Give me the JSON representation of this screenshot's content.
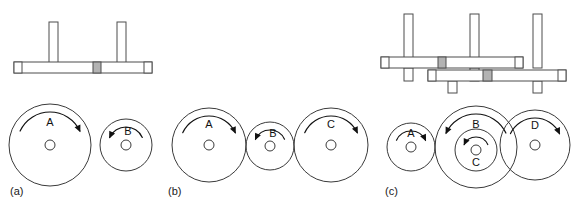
{
  "figure": {
    "background_color": "#ffffff",
    "outline_color": "#4d4d4d",
    "wheel_stroke_color": "#3a3a3a",
    "shaded_block_color": "#b3b3b3",
    "arrow_color": "#111111",
    "width": 578,
    "height": 207
  },
  "panels": [
    {
      "id": "a",
      "caption": "(a)",
      "caption_x": 10,
      "caption_y": 192,
      "description": "Two meshing wheels on a single shaft assembly",
      "side_view": {
        "shafts": [
          {
            "name": "main-shaft",
            "x": 14,
            "y": 62,
            "width": 138,
            "height": 11,
            "end_caps": [
              {
                "x": 14,
                "y": 62,
                "width": 8,
                "height": 11
              },
              {
                "x": 144,
                "y": 62,
                "width": 8,
                "height": 11
              }
            ],
            "shaded_blocks": [
              {
                "x": 93,
                "y": 62,
                "width": 8,
                "height": 11
              }
            ]
          }
        ],
        "posts": [
          {
            "name": "post-a",
            "x": 49,
            "y": 22,
            "width": 9,
            "height": 48
          },
          {
            "name": "post-b",
            "x": 117,
            "y": 22,
            "width": 9,
            "height": 48
          }
        ]
      },
      "wheels": [
        {
          "name": "wheel-a",
          "label": "A",
          "cx": 50,
          "cy": 145,
          "r": 41,
          "hub_r": 5,
          "direction": "clockwise",
          "label_dx": 0,
          "label_dy": -22
        },
        {
          "name": "wheel-b",
          "label": "B",
          "cx": 126,
          "cy": 145,
          "r": 26,
          "hub_r": 5,
          "direction": "counterclockwise",
          "label_dx": 2,
          "label_dy": -13
        }
      ]
    },
    {
      "id": "b",
      "caption": "(b)",
      "caption_x": 168,
      "caption_y": 192,
      "description": "Three wheels in series: large, small idler, large",
      "side_view": {
        "shafts": [],
        "posts": []
      },
      "wheels": [
        {
          "name": "wheel-a",
          "label": "A",
          "cx": 209,
          "cy": 145,
          "r": 37,
          "hub_r": 5,
          "direction": "clockwise",
          "label_dx": 0,
          "label_dy": -20
        },
        {
          "name": "wheel-b",
          "label": "B",
          "cx": 270,
          "cy": 146,
          "r": 24,
          "hub_r": 5,
          "direction": "counterclockwise",
          "label_dx": 3,
          "label_dy": -12
        },
        {
          "name": "wheel-c",
          "label": "C",
          "cx": 331,
          "cy": 145,
          "r": 37,
          "hub_r": 5,
          "direction": "clockwise",
          "label_dx": 0,
          "label_dy": -20
        }
      ]
    },
    {
      "id": "c",
      "caption": "(c)",
      "caption_x": 385,
      "caption_y": 192,
      "description": "Compound train with stepped shafts and concentric wheels B and C",
      "side_view": {
        "shafts": [
          {
            "name": "upper-shaft",
            "x": 381,
            "y": 57,
            "width": 142,
            "height": 11,
            "end_caps": [
              {
                "x": 381,
                "y": 57,
                "width": 8,
                "height": 11
              },
              {
                "x": 515,
                "y": 57,
                "width": 8,
                "height": 11
              }
            ],
            "shaded_blocks": [
              {
                "x": 438,
                "y": 57,
                "width": 8,
                "height": 11
              }
            ]
          },
          {
            "name": "lower-shaft",
            "x": 428,
            "y": 70,
            "width": 138,
            "height": 11,
            "end_caps": [
              {
                "x": 428,
                "y": 70,
                "width": 8,
                "height": 11
              },
              {
                "x": 558,
                "y": 70,
                "width": 8,
                "height": 11
              }
            ],
            "shaded_blocks": [
              {
                "x": 483,
                "y": 70,
                "width": 9,
                "height": 11
              }
            ]
          }
        ],
        "posts": [
          {
            "name": "post-a",
            "x": 404,
            "y": 14,
            "width": 9,
            "height": 54
          },
          {
            "name": "post-b",
            "x": 470,
            "y": 14,
            "width": 9,
            "height": 54
          },
          {
            "name": "post-d",
            "x": 533,
            "y": 14,
            "width": 9,
            "height": 54
          },
          {
            "name": "post-a-lower",
            "x": 404,
            "y": 68,
            "width": 9,
            "height": 13
          },
          {
            "name": "post-b-lower",
            "x": 470,
            "y": 68,
            "width": 9,
            "height": 13
          },
          {
            "name": "post-c-lower",
            "x": 448,
            "y": 81,
            "width": 9,
            "height": 12
          },
          {
            "name": "post-d-lower",
            "x": 533,
            "y": 81,
            "width": 9,
            "height": 12
          }
        ]
      },
      "wheels": [
        {
          "name": "wheel-a",
          "label": "A",
          "cx": 411,
          "cy": 147,
          "r": 24,
          "hub_r": 5,
          "direction": "clockwise",
          "label_dx": 0,
          "label_dy": -13
        },
        {
          "name": "wheel-b",
          "label": "B",
          "cx": 476,
          "cy": 147,
          "r": 41,
          "hub_r": 0,
          "direction": "counterclockwise",
          "label_dx": 0,
          "label_dy": -22
        },
        {
          "name": "wheel-c",
          "label": "C",
          "cx": 476,
          "cy": 150,
          "r": 21,
          "hub_r": 5,
          "direction": "counterclockwise",
          "label_dx": 0,
          "label_dy": 13
        },
        {
          "name": "wheel-d",
          "label": "D",
          "cx": 535,
          "cy": 145,
          "r": 35,
          "hub_r": 5,
          "direction": "clockwise",
          "label_dx": 0,
          "label_dy": -19
        }
      ]
    }
  ]
}
